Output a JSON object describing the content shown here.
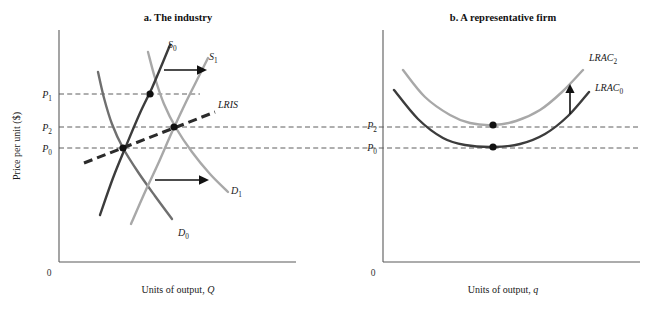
{
  "figure": {
    "background": "#ffffff",
    "width": 654,
    "height": 309
  },
  "panels": [
    {
      "id": "industry",
      "title": "a. The industry",
      "y_axis_label": "Price per unit ($)",
      "x_axis_label": "Units of output, Q",
      "x_axis_label_plain": "Units of output, ",
      "x_axis_label_italic": "Q",
      "origin_label": "0",
      "price_ticks": [
        {
          "label": "P",
          "sub": "1",
          "name": "P1"
        },
        {
          "label": "P",
          "sub": "2",
          "name": "P2"
        },
        {
          "label": "P",
          "sub": "0",
          "name": "P0"
        }
      ],
      "curve_labels": [
        {
          "label": "S",
          "sub": "0",
          "name": "S0"
        },
        {
          "label": "S",
          "sub": "1",
          "name": "S1"
        },
        {
          "label": "D",
          "sub": "0",
          "name": "D0"
        },
        {
          "label": "D",
          "sub": "1",
          "name": "D1"
        },
        {
          "label": "LRIS",
          "sub": "",
          "name": "LRIS"
        }
      ]
    },
    {
      "id": "firm",
      "title": "b. A representative firm",
      "x_axis_label": "Units of output, q",
      "x_axis_label_plain": "Units of output, ",
      "x_axis_label_italic": "q",
      "origin_label": "0",
      "price_ticks": [
        {
          "label": "P",
          "sub": "2",
          "name": "P2"
        },
        {
          "label": "P",
          "sub": "0",
          "name": "P0"
        }
      ],
      "curve_labels": [
        {
          "label": "LRAC",
          "sub": "2",
          "name": "LRAC2"
        },
        {
          "label": "LRAC",
          "sub": "0",
          "name": "LRAC0"
        }
      ]
    }
  ],
  "colors": {
    "curve_dark": "#3c3c3c",
    "curve_light": "#a8a8a8",
    "curve_mid": "#6f6f6f",
    "axis": "#5a5a5a",
    "guide": "#4d4d4d",
    "dot": "#111111",
    "arrow": "#111111",
    "text": "#1a1a1a"
  },
  "chart_data": {
    "type": "line",
    "panel_count": 2,
    "charts": [
      {
        "type": "line",
        "title": "a. The industry",
        "xlabel": "Units of output, Q",
        "ylabel": "Price per unit ($)",
        "grid": false,
        "legend": "inline-curve-labels",
        "axis_origin": {
          "x": 59,
          "y": 262
        },
        "axis_top": 30,
        "axis_right": 296,
        "price_levels": [
          {
            "name": "P1",
            "y_px": 94,
            "value": "P1",
            "guide_from_x": 59,
            "guide_to_x": 200
          },
          {
            "name": "P2",
            "y_px": 127,
            "value": "P2",
            "guide_from_x": 59,
            "guide_to_x": 640
          },
          {
            "name": "P0",
            "y_px": 148,
            "value": "P0",
            "guide_from_x": 59,
            "guide_to_x": 640
          }
        ],
        "series": [
          {
            "name": "S0",
            "role": "short-run supply, initial",
            "color": "#3c3c3c",
            "style": "solid",
            "label_at": {
              "x": 168,
              "y": 48
            },
            "points": [
              [
                100,
                215
              ],
              [
                113,
                178
              ],
              [
                126,
                146
              ],
              [
                140,
                113
              ],
              [
                152,
                88
              ],
              [
                163,
                62
              ],
              [
                170,
                45
              ]
            ]
          },
          {
            "name": "S1",
            "role": "short-run supply, after entry",
            "color": "#a8a8a8",
            "style": "solid",
            "label_at": {
              "x": 210,
              "y": 60
            },
            "points": [
              [
                131,
                224
              ],
              [
                145,
                192
              ],
              [
                158,
                164
              ],
              [
                172,
                132
              ],
              [
                186,
                102
              ],
              [
                199,
                76
              ],
              [
                208,
                58
              ]
            ]
          },
          {
            "name": "D0",
            "role": "demand, initial",
            "color": "#6f6f6f",
            "style": "solid",
            "label_at": {
              "x": 180,
              "y": 235
            },
            "points": [
              [
                98,
                72
              ],
              [
                104,
                98
              ],
              [
                112,
                124
              ],
              [
                123,
                148
              ],
              [
                138,
                172
              ],
              [
                155,
                196
              ],
              [
                172,
                219
              ]
            ]
          },
          {
            "name": "D1",
            "role": "demand, after increase",
            "color": "#a8a8a8",
            "style": "solid",
            "label_at": {
              "x": 232,
              "y": 193
            },
            "points": [
              [
                148,
                52
              ],
              [
                155,
                78
              ],
              [
                164,
                104
              ],
              [
                176,
                128
              ],
              [
                192,
                152
              ],
              [
                210,
                174
              ],
              [
                228,
                192
              ]
            ]
          },
          {
            "name": "LRIS",
            "role": "long-run industry supply",
            "color": "#2b2b2b",
            "style": "dashed-thick",
            "label_at": {
              "x": 218,
              "y": 105
            },
            "points": [
              [
                84,
                163
              ],
              [
                215,
                112
              ]
            ]
          }
        ],
        "equilibria": [
          {
            "name": "E0",
            "x_px": 123,
            "y_px": 148,
            "price": "P0"
          },
          {
            "name": "E1",
            "x_px": 150,
            "y_px": 94,
            "price": "P1"
          },
          {
            "name": "E2",
            "x_px": 174,
            "y_px": 127,
            "price": "P2"
          }
        ],
        "annotations": [
          {
            "type": "arrow",
            "name": "supply-shift-arrow",
            "direction": "right",
            "from": [
              165,
              70
            ],
            "to": [
              205,
              70
            ]
          },
          {
            "type": "arrow",
            "name": "demand-shift-arrow",
            "direction": "right",
            "from": [
              155,
              180
            ],
            "to": [
              207,
              180
            ]
          }
        ]
      },
      {
        "type": "line",
        "title": "b. A representative firm",
        "xlabel": "Units of output, q",
        "ylabel": "",
        "grid": false,
        "legend": "inline-curve-labels",
        "axis_origin": {
          "x": 383,
          "y": 262
        },
        "axis_top": 30,
        "axis_right": 640,
        "price_levels": [
          {
            "name": "P2",
            "y_px": 125,
            "value": "P2"
          },
          {
            "name": "P0",
            "y_px": 147,
            "value": "P0"
          }
        ],
        "series": [
          {
            "name": "LRAC2",
            "role": "long-run average cost, after input price rise",
            "color": "#a8a8a8",
            "style": "solid",
            "label_at": {
              "x": 590,
              "y": 61
            },
            "points": [
              [
                403,
                70
              ],
              [
                425,
                97
              ],
              [
                450,
                115
              ],
              [
                470,
                123
              ],
              [
                493,
                125
              ],
              [
                516,
                121
              ],
              [
                540,
                110
              ],
              [
                562,
                92
              ],
              [
                583,
                70
              ]
            ]
          },
          {
            "name": "LRAC0",
            "role": "long-run average cost, initial",
            "color": "#3c3c3c",
            "style": "solid",
            "label_at": {
              "x": 596,
              "y": 91
            },
            "points": [
              [
                394,
                90
              ],
              [
                418,
                119
              ],
              [
                443,
                138
              ],
              [
                465,
                145
              ],
              [
                493,
                147
              ],
              [
                520,
                144
              ],
              [
                545,
                134
              ],
              [
                568,
                116
              ],
              [
                589,
                92
              ]
            ]
          }
        ],
        "equilibria": [
          {
            "name": "F2",
            "x_px": 493,
            "y_px": 125,
            "price": "P2"
          },
          {
            "name": "F0",
            "x_px": 493,
            "y_px": 147,
            "price": "P0"
          }
        ],
        "annotations": [
          {
            "type": "arrow",
            "name": "cost-shift-arrow",
            "direction": "up",
            "from": [
              570,
              113
            ],
            "to": [
              570,
              87
            ]
          }
        ]
      }
    ]
  }
}
